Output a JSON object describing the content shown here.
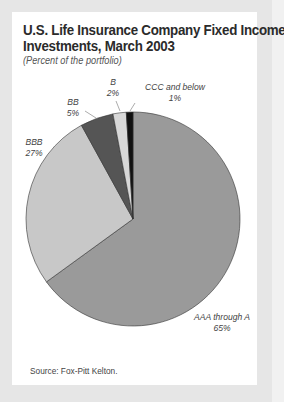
{
  "chart_data": {
    "type": "pie",
    "title": "U.S. Life Insurance Company Fixed Income Investments, March 2003",
    "subtitle": "(Percent of the portfolio)",
    "categories": [
      "AAA through A",
      "BBB",
      "BB",
      "B",
      "CCC and below"
    ],
    "values": [
      65,
      27,
      5,
      2,
      1
    ],
    "unit": "%",
    "colors": [
      "#9a9a9a",
      "#c8c8c8",
      "#555555",
      "#d8d8d8",
      "#111111"
    ],
    "start_angle": "12 o'clock",
    "direction": "clockwise",
    "source": "Source: Fox-Pitt Kelton."
  },
  "header": {
    "title_line1": "U.S. Life Insurance Company Fixed Income",
    "title_line2": "Investments, March 2003",
    "subtitle": "(Percent of the portfolio)"
  },
  "labels": {
    "aaa": {
      "name": "AAA through A",
      "pct": "65%"
    },
    "bbb": {
      "name": "BBB",
      "pct": "27%"
    },
    "bb": {
      "name": "BB",
      "pct": "5%"
    },
    "b": {
      "name": "B",
      "pct": "2%"
    },
    "ccc": {
      "name": "CCC and below",
      "pct": "1%"
    }
  },
  "footer": {
    "source": "Source: Fox-Pitt Kelton."
  }
}
